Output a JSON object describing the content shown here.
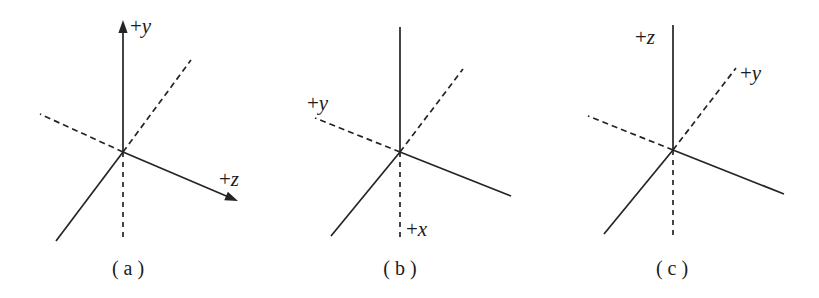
{
  "figure": {
    "background_color": "#ffffff",
    "line_color": "#242424",
    "text_color": "#1c1c1c",
    "width": 819,
    "height": 298,
    "panels": [
      {
        "id": "a",
        "caption": "( a )",
        "caption_x": 128,
        "caption_y": 275,
        "origin_x": 123,
        "origin_y": 152,
        "axes": [
          {
            "name": "y-axis-positive",
            "label": "+y",
            "sign": "+",
            "letter": "y",
            "style": "solid",
            "arrow": true,
            "x1": 123,
            "y1": 152,
            "x2": 123,
            "y2": 20,
            "label_x": 130,
            "label_y": 33
          },
          {
            "name": "z-axis-positive",
            "label": "+z",
            "sign": "+",
            "letter": "z",
            "style": "solid",
            "arrow": true,
            "x1": 123,
            "y1": 152,
            "x2": 238,
            "y2": 201,
            "label_x": 219,
            "label_y": 186
          },
          {
            "name": "x-axis-positive-dashed",
            "label": "",
            "style": "dashed",
            "arrow": false,
            "x1": 123,
            "y1": 152,
            "x2": 191,
            "y2": 60,
            "label_x": 0,
            "label_y": 0
          },
          {
            "name": "y-axis-negative-dashed",
            "label": "",
            "style": "dashed",
            "arrow": false,
            "x1": 123,
            "y1": 152,
            "x2": 40,
            "y2": 114,
            "label_x": 0,
            "label_y": 0
          },
          {
            "name": "x-axis-negative-solid",
            "label": "",
            "style": "solid",
            "arrow": false,
            "x1": 123,
            "y1": 152,
            "x2": 56,
            "y2": 241,
            "label_x": 0,
            "label_y": 0
          },
          {
            "name": "z-axis-negative-dashed",
            "label": "",
            "style": "dashed-vertical",
            "arrow": false,
            "x1": 123,
            "y1": 152,
            "x2": 123,
            "y2": 241,
            "label_x": 0,
            "label_y": 0
          }
        ]
      },
      {
        "id": "b",
        "caption": "( b )",
        "caption_x": 400,
        "caption_y": 275,
        "origin_x": 400,
        "origin_y": 152,
        "axes": [
          {
            "name": "z-axis-vertical-solid",
            "label": "",
            "style": "solid",
            "arrow": false,
            "x1": 400,
            "y1": 152,
            "x2": 400,
            "y2": 27,
            "label_x": 0,
            "label_y": 0
          },
          {
            "name": "z-axis-upper-right-dashed",
            "label": "",
            "style": "dashed",
            "arrow": false,
            "x1": 400,
            "y1": 152,
            "x2": 463,
            "y2": 69,
            "label_x": 0,
            "label_y": 0
          },
          {
            "name": "y-axis-positive-dashed",
            "label": "+y",
            "sign": "+",
            "letter": "y",
            "style": "dashed",
            "arrow": false,
            "x1": 400,
            "y1": 152,
            "x2": 315,
            "y2": 118,
            "label_x": 307,
            "label_y": 110
          },
          {
            "name": "axis-lower-right-solid",
            "label": "",
            "style": "solid",
            "arrow": false,
            "x1": 400,
            "y1": 152,
            "x2": 511,
            "y2": 196,
            "label_x": 0,
            "label_y": 0
          },
          {
            "name": "axis-lower-left-solid",
            "label": "",
            "style": "solid",
            "arrow": false,
            "x1": 400,
            "y1": 152,
            "x2": 331,
            "y2": 236,
            "label_x": 0,
            "label_y": 0
          },
          {
            "name": "x-axis-positive-dashed",
            "label": "+x",
            "sign": "+",
            "letter": "x",
            "style": "dashed-vertical",
            "arrow": false,
            "x1": 400,
            "y1": 152,
            "x2": 400,
            "y2": 241,
            "label_x": 406,
            "label_y": 236
          }
        ]
      },
      {
        "id": "c",
        "caption": "( c )",
        "caption_x": 672,
        "caption_y": 275,
        "origin_x": 673,
        "origin_y": 150,
        "axes": [
          {
            "name": "z-axis-positive-solid",
            "label": "+z",
            "sign": "+",
            "letter": "z",
            "style": "solid",
            "arrow": false,
            "x1": 673,
            "y1": 150,
            "x2": 673,
            "y2": 25,
            "label_x": 635,
            "label_y": 44
          },
          {
            "name": "y-axis-positive-dashed",
            "label": "+y",
            "sign": "+",
            "letter": "y",
            "style": "dashed",
            "arrow": false,
            "x1": 673,
            "y1": 150,
            "x2": 736,
            "y2": 68,
            "label_x": 740,
            "label_y": 80
          },
          {
            "name": "y-axis-negative-dashed",
            "label": "",
            "style": "dashed",
            "arrow": false,
            "x1": 673,
            "y1": 150,
            "x2": 588,
            "y2": 116,
            "label_x": 0,
            "label_y": 0
          },
          {
            "name": "x-axis-lower-right-solid",
            "label": "",
            "style": "solid",
            "arrow": false,
            "x1": 673,
            "y1": 150,
            "x2": 784,
            "y2": 194,
            "label_x": 0,
            "label_y": 0
          },
          {
            "name": "x-axis-lower-left-solid",
            "label": "",
            "style": "solid",
            "arrow": false,
            "x1": 673,
            "y1": 150,
            "x2": 604,
            "y2": 234,
            "label_x": 0,
            "label_y": 0
          },
          {
            "name": "z-axis-negative-dashed",
            "label": "",
            "style": "dashed-vertical",
            "arrow": false,
            "x1": 673,
            "y1": 150,
            "x2": 673,
            "y2": 239,
            "label_x": 0,
            "label_y": 0
          }
        ]
      }
    ]
  }
}
